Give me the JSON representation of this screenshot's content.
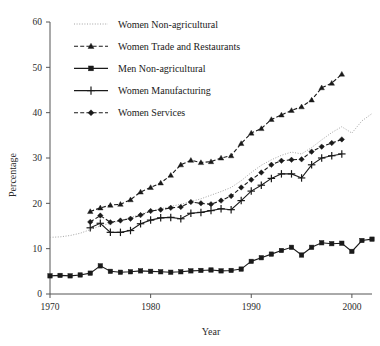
{
  "chart_data": {
    "type": "line",
    "title": "",
    "xlabel": "Year",
    "ylabel": "Percentage",
    "xlim": [
      1970,
      2002
    ],
    "ylim": [
      0,
      60
    ],
    "xticks": [
      1970,
      1980,
      1990,
      2000
    ],
    "yticks": [
      0,
      10,
      20,
      30,
      40,
      50,
      60
    ],
    "grid": false,
    "legend_position": "upper-left",
    "series": [
      {
        "name": "Women Non-agricultural",
        "style": "dotted",
        "marker": "none",
        "color": "#9a9a9a",
        "x": [
          1970,
          1971,
          1972,
          1973,
          1974,
          1975,
          1976,
          1977,
          1978,
          1979,
          1980,
          1981,
          1982,
          1983,
          1984,
          1985,
          1986,
          1987,
          1988,
          1989,
          1990,
          1991,
          1992,
          1993,
          1994,
          1995,
          1996,
          1997,
          1998,
          1999,
          2000,
          2001,
          2002
        ],
        "y": [
          12.5,
          12.6,
          12.9,
          13.4,
          14.2,
          15.0,
          15.6,
          16.2,
          16.9,
          17.6,
          18.3,
          18.8,
          19.3,
          19.8,
          20.4,
          21.0,
          21.8,
          22.6,
          23.5,
          25.0,
          26.8,
          28.4,
          29.6,
          30.6,
          31.3,
          30.9,
          32.3,
          34.0,
          35.6,
          36.9,
          35.5,
          38.2,
          39.8
        ]
      },
      {
        "name": "Women Trade and Restaurants",
        "style": "dashed",
        "marker": "triangle",
        "color": "#1a1a1a",
        "x": [
          1974,
          1975,
          1976,
          1977,
          1978,
          1979,
          1980,
          1981,
          1982,
          1983,
          1984,
          1985,
          1986,
          1987,
          1988,
          1989,
          1990,
          1991,
          1992,
          1993,
          1994,
          1995,
          1996,
          1997,
          1998,
          1999
        ],
        "y": [
          18.2,
          19.0,
          19.6,
          19.8,
          20.8,
          22.5,
          23.5,
          24.5,
          26.2,
          28.5,
          29.5,
          29.0,
          29.2,
          30.0,
          30.5,
          33.2,
          35.5,
          36.5,
          38.5,
          39.5,
          40.5,
          41.3,
          42.8,
          45.5,
          46.5,
          48.5
        ]
      },
      {
        "name": "Men Non-agricultural",
        "style": "solid",
        "marker": "square",
        "color": "#1a1a1a",
        "x": [
          1970,
          1971,
          1972,
          1973,
          1974,
          1975,
          1976,
          1977,
          1978,
          1979,
          1980,
          1981,
          1982,
          1983,
          1984,
          1985,
          1986,
          1987,
          1988,
          1989,
          1990,
          1991,
          1992,
          1993,
          1994,
          1995,
          1996,
          1997,
          1998,
          1999,
          2000,
          2001,
          2002
        ],
        "y": [
          4.0,
          4.1,
          4.0,
          4.2,
          4.6,
          6.2,
          5.0,
          4.8,
          4.9,
          5.1,
          5.0,
          4.9,
          4.8,
          4.9,
          5.1,
          5.2,
          5.3,
          5.1,
          5.2,
          5.5,
          7.2,
          8.0,
          8.8,
          9.6,
          10.3,
          8.6,
          10.3,
          11.3,
          11.1,
          11.2,
          9.4,
          11.8,
          12.1
        ]
      },
      {
        "name": "Women Manufacturing",
        "style": "solid",
        "marker": "plus",
        "color": "#1a1a1a",
        "x": [
          1974,
          1975,
          1976,
          1977,
          1978,
          1979,
          1980,
          1981,
          1982,
          1983,
          1984,
          1985,
          1986,
          1987,
          1988,
          1989,
          1990,
          1991,
          1992,
          1993,
          1994,
          1995,
          1996,
          1997,
          1998,
          1999
        ],
        "y": [
          14.6,
          15.6,
          13.6,
          13.6,
          14.0,
          15.5,
          16.3,
          16.8,
          16.9,
          16.6,
          17.8,
          18.0,
          18.4,
          18.8,
          18.6,
          20.6,
          22.7,
          24.0,
          25.5,
          26.5,
          26.5,
          25.6,
          28.5,
          30.0,
          30.5,
          30.9
        ]
      },
      {
        "name": "Women Services",
        "style": "dashed",
        "marker": "diamond",
        "color": "#1a1a1a",
        "x": [
          1974,
          1975,
          1976,
          1977,
          1978,
          1979,
          1980,
          1981,
          1982,
          1983,
          1984,
          1985,
          1986,
          1987,
          1988,
          1989,
          1990,
          1991,
          1992,
          1993,
          1994,
          1995,
          1996,
          1997,
          1998,
          1999
        ],
        "y": [
          15.9,
          17.3,
          15.8,
          16.2,
          16.6,
          17.4,
          18.3,
          18.6,
          19.0,
          19.2,
          20.3,
          20.0,
          19.8,
          20.6,
          21.6,
          23.5,
          25.2,
          26.8,
          28.5,
          29.4,
          29.6,
          29.7,
          31.4,
          32.5,
          33.3,
          34.1
        ]
      }
    ]
  },
  "axes": {
    "x_tick_labels": [
      "1970",
      "1980",
      "1990",
      "2000"
    ],
    "y_tick_labels": [
      "0",
      "10",
      "20",
      "30",
      "40",
      "50",
      "60"
    ],
    "x_title": "Year",
    "y_title": "Percentage"
  },
  "legend": {
    "entries": [
      {
        "label": "Women Non-agricultural"
      },
      {
        "label": "Women Trade and Restaurants"
      },
      {
        "label": "Men Non-agricultural"
      },
      {
        "label": "Women Manufacturing"
      },
      {
        "label": "Women Services"
      }
    ]
  }
}
